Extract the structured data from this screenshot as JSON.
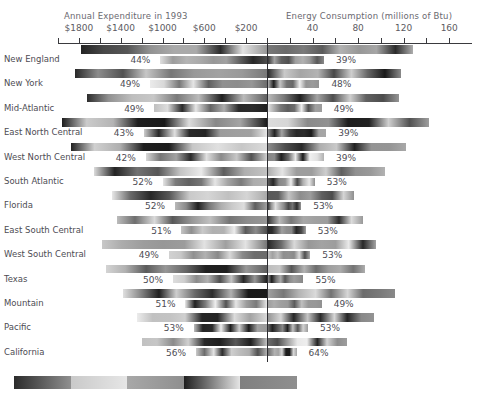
{
  "chart_data": {
    "type": "bar",
    "subtype": "butterfly-tornado-dual-axis",
    "title": "",
    "left_axis": {
      "label": "Annual Expenditure in 1993",
      "ticks": [
        "$1800",
        "$1400",
        "$1000",
        "$600",
        "$200"
      ],
      "tick_values": [
        1800,
        1400,
        1000,
        600,
        200
      ],
      "minor_ticks": [
        1600,
        1200,
        800,
        400
      ],
      "range": [
        2000,
        0
      ],
      "direction": "right-to-left"
    },
    "right_axis": {
      "label": "Energy Consumption (millions of Btu)",
      "ticks": [
        "40",
        "80",
        "120",
        "160"
      ],
      "tick_values": [
        40,
        80,
        120,
        160
      ],
      "minor_ticks": [
        20,
        60,
        100,
        140
      ],
      "range": [
        0,
        180
      ],
      "direction": "left-to-right"
    },
    "categories": [
      "New England",
      "New York",
      "Mid-Atlantic",
      "East North Central",
      "West North Central",
      "South Atlantic",
      "Florida",
      "East South Central",
      "West South Central",
      "Texas",
      "Mountain",
      "Pacific",
      "California"
    ],
    "series": [
      {
        "name": "Annual Expenditure in 1993",
        "side": "left",
        "unit": "dollars",
        "upper_values": [
          1780,
          1840,
          1720,
          1960,
          1880,
          1660,
          1480,
          1440,
          1580,
          1540,
          1380,
          1240,
          1200
        ],
        "lower_values": [
          1020,
          1120,
          1080,
          1180,
          1160,
          1000,
          880,
          820,
          940,
          900,
          780,
          700,
          680
        ]
      },
      {
        "name": "Energy Consumption (millions of Btu)",
        "side": "right",
        "unit": "millions of Btu",
        "upper_values": [
          128,
          118,
          116,
          142,
          122,
          104,
          76,
          84,
          96,
          86,
          112,
          94,
          70
        ],
        "lower_values": [
          50,
          46,
          48,
          52,
          50,
          42,
          30,
          34,
          38,
          32,
          48,
          36,
          26
        ]
      }
    ],
    "left_percent_labels": [
      "44%",
      "49%",
      "49%",
      "43%",
      "42%",
      "52%",
      "52%",
      "51%",
      "49%",
      "50%",
      "51%",
      "53%",
      "56%"
    ],
    "right_percent_labels": [
      "39%",
      "48%",
      "49%",
      "39%",
      "39%",
      "53%",
      "53%",
      "53%",
      "53%",
      "55%",
      "49%",
      "53%",
      "64%"
    ],
    "legend": {
      "type": "grayscale-color-scale",
      "position": "bottom-left",
      "segments": [
        "#2b2b2b",
        "#c9c9c9",
        "#a8a8a8",
        "#1e1e1e",
        "#808080"
      ]
    },
    "grid": false,
    "colors": {
      "axis": "#2e2e32",
      "text": "#4d4c53",
      "title": "#6a6970",
      "background": "#ffffff"
    }
  },
  "rows": [
    {
      "label": "New England",
      "left_pct": "44%",
      "right_pct": "39%",
      "lu": 1780,
      "ll": 1020,
      "ru": 128,
      "rl": 50
    },
    {
      "label": "New York",
      "left_pct": "49%",
      "right_pct": "48%",
      "lu": 1840,
      "ll": 1120,
      "ru": 118,
      "rl": 46
    },
    {
      "label": "Mid-Atlantic",
      "left_pct": "49%",
      "right_pct": "49%",
      "lu": 1720,
      "ll": 1080,
      "ru": 116,
      "rl": 48
    },
    {
      "label": "East North Central",
      "left_pct": "43%",
      "right_pct": "39%",
      "lu": 1960,
      "ll": 1180,
      "ru": 142,
      "rl": 52
    },
    {
      "label": "West North Central",
      "left_pct": "42%",
      "right_pct": "39%",
      "lu": 1880,
      "ll": 1160,
      "ru": 122,
      "rl": 50
    },
    {
      "label": "South Atlantic",
      "left_pct": "52%",
      "right_pct": "53%",
      "lu": 1660,
      "ll": 1000,
      "ru": 104,
      "rl": 42
    },
    {
      "label": "Florida",
      "left_pct": "52%",
      "right_pct": "53%",
      "lu": 1480,
      "ll": 880,
      "ru": 76,
      "rl": 30
    },
    {
      "label": "East South Central",
      "left_pct": "51%",
      "right_pct": "53%",
      "lu": 1440,
      "ll": 820,
      "ru": 84,
      "rl": 34
    },
    {
      "label": "West South Central",
      "left_pct": "49%",
      "right_pct": "53%",
      "lu": 1580,
      "ll": 940,
      "ru": 96,
      "rl": 38
    },
    {
      "label": "Texas",
      "left_pct": "50%",
      "right_pct": "55%",
      "lu": 1540,
      "ll": 900,
      "ru": 86,
      "rl": 32
    },
    {
      "label": "Mountain",
      "left_pct": "51%",
      "right_pct": "49%",
      "lu": 1380,
      "ll": 780,
      "ru": 112,
      "rl": 48
    },
    {
      "label": "Pacific",
      "left_pct": "53%",
      "right_pct": "53%",
      "lu": 1240,
      "ll": 700,
      "ru": 94,
      "rl": 36
    },
    {
      "label": "California",
      "left_pct": "56%",
      "right_pct": "64%",
      "lu": 1200,
      "ll": 680,
      "ru": 70,
      "rl": 26
    }
  ],
  "header": {
    "left_title": "Annual Expenditure in 1993",
    "right_title": "Energy Consumption (millions of Btu)",
    "left_ticks": [
      "$1800",
      "$1400",
      "$1000",
      "$600",
      "$200"
    ],
    "right_ticks": [
      "40",
      "80",
      "120",
      "160"
    ]
  }
}
